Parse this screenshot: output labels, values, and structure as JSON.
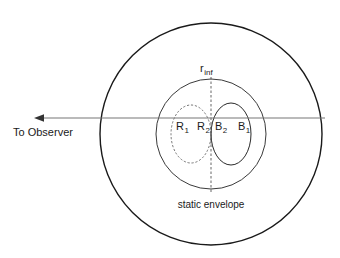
{
  "figure": {
    "title": "",
    "background_color": "#ffffff",
    "stroke_color": "#1a1a1a",
    "dashed_color": "#555555",
    "axis_color": "#555555"
  },
  "labels": {
    "r_inf": {
      "base": "r",
      "sub": "inf"
    },
    "region_r1": {
      "base": "R",
      "sub": "1"
    },
    "region_r2": {
      "base": "R",
      "sub": "2"
    },
    "region_b2": {
      "base": "B",
      "sub": "2"
    },
    "region_b1": {
      "base": "B",
      "sub": "1"
    },
    "static_envelope": "static envelope",
    "to_observer": "To Observer"
  },
  "geometry": {
    "outer_circle": {
      "cx": 211,
      "cy": 134,
      "r": 111
    },
    "middle_circle": {
      "cx": 211,
      "cy": 134,
      "r": 55
    },
    "left_lobe": {
      "cx": 191,
      "cy": 134,
      "rx": 20,
      "ry": 29,
      "style": "dashed"
    },
    "right_lobe": {
      "cx": 231,
      "cy": 134,
      "rx": 20,
      "ry": 31,
      "style": "solid"
    },
    "vertical_axis": {
      "x": 211,
      "y1": 77,
      "y2": 192,
      "style": "dashed"
    },
    "observer_ray": {
      "x1": 325,
      "x2": 35,
      "y": 118,
      "arrow": "left"
    }
  }
}
